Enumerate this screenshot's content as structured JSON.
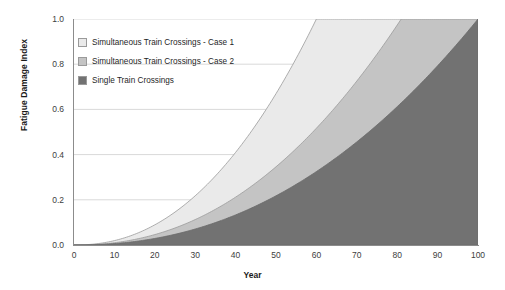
{
  "chart_data": {
    "type": "area",
    "title": "",
    "xlabel": "Year",
    "ylabel": "Fatigue Damage Index",
    "xlim": [
      0,
      100
    ],
    "ylim": [
      0,
      1.0
    ],
    "xticks": [
      0,
      10,
      20,
      30,
      40,
      50,
      60,
      70,
      80,
      90,
      100
    ],
    "yticks": [
      "0.0",
      "0.2",
      "0.4",
      "0.6",
      "0.8",
      "1.0"
    ],
    "grid": "horizontal",
    "legend_position": "upper-left-inside",
    "x": [
      0,
      10,
      20,
      30,
      40,
      50,
      60,
      70,
      80,
      90,
      100
    ],
    "series": [
      {
        "name": "Simultaneous Train Crossings - Case 1",
        "color": "#EAEAEA",
        "edge_color": "#9a9a9a",
        "reaches_full_damage_year": 60,
        "values": [
          0.0,
          0.022,
          0.101,
          0.248,
          0.464,
          0.725,
          1.0,
          1.0,
          1.0,
          1.0,
          1.0
        ]
      },
      {
        "name": "Simultaneous Train Crossings - Case 2",
        "color": "#C4C4C4",
        "edge_color": "#9a9a9a",
        "reaches_full_damage_year": 81,
        "values": [
          0.0,
          0.011,
          0.051,
          0.124,
          0.233,
          0.377,
          0.556,
          0.77,
          1.0,
          1.0,
          1.0
        ]
      },
      {
        "name": "Single Train Crossings",
        "color": "#727272",
        "edge_color": "#6a6a6a",
        "reaches_full_damage_year": 100,
        "values": [
          0.0,
          0.006,
          0.029,
          0.071,
          0.133,
          0.216,
          0.318,
          0.44,
          0.583,
          0.745,
          1.0
        ]
      }
    ]
  },
  "legend": {
    "items": [
      {
        "label": "Simultaneous Train Crossings - Case 1",
        "color": "#EAEAEA"
      },
      {
        "label": "Simultaneous Train Crossings - Case 2",
        "color": "#C4C4C4"
      },
      {
        "label": "Single Train Crossings",
        "color": "#727272"
      }
    ]
  },
  "axes": {
    "x_title": "Year",
    "y_title": "Fatigue Damage Index",
    "x_tick_labels": [
      "0",
      "10",
      "20",
      "30",
      "40",
      "50",
      "60",
      "70",
      "80",
      "90",
      "100"
    ],
    "y_tick_labels": [
      "0.0",
      "0.2",
      "0.4",
      "0.6",
      "0.8",
      "1.0"
    ]
  },
  "colors": {
    "grid": "#D9D9D9",
    "axis": "#8c8c8c",
    "text": "#3d3d3d",
    "title_text": "#1a1a1a",
    "background": "#FFFFFF"
  }
}
